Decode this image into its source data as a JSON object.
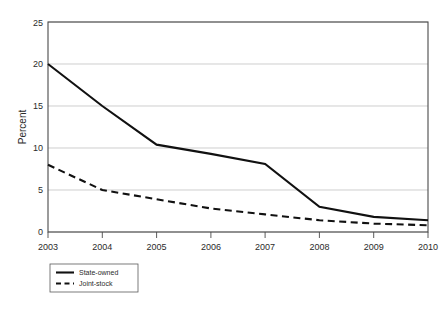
{
  "chart_data": {
    "type": "line",
    "title": "",
    "xlabel": "",
    "ylabel": "Percent",
    "x": [
      "2003",
      "2004",
      "2005",
      "2006",
      "2007",
      "2008",
      "2009",
      "2010"
    ],
    "categories": [
      "2003",
      "2004",
      "2005",
      "2006",
      "2007",
      "2008",
      "2009",
      "2010"
    ],
    "series": [
      {
        "name": "State-owned",
        "style": "solid",
        "values": [
          20.0,
          15.0,
          10.4,
          9.3,
          8.1,
          3.0,
          1.8,
          1.4
        ]
      },
      {
        "name": "Joint-stock",
        "style": "dashed",
        "values": [
          8.0,
          5.0,
          3.9,
          2.8,
          2.1,
          1.4,
          1.0,
          0.8
        ]
      }
    ],
    "ylim": [
      0,
      25
    ],
    "yticks": [
      0,
      5,
      10,
      15,
      20,
      25
    ],
    "ytick_labels": [
      "0",
      "5",
      "10",
      "15",
      "20",
      "25"
    ],
    "xtick_labels": [
      "2003",
      "2004",
      "2005",
      "2006",
      "2007",
      "2008",
      "2009",
      "2010"
    ],
    "grid": "horizontal",
    "legend_position": "below-left",
    "colors": {
      "line": "#111111",
      "gridline": "#b9b9b9",
      "frame": "#4a4a4a",
      "background": "#ffffff",
      "text": "#2b2b2b"
    }
  },
  "legend": {
    "entries": [
      {
        "label": "State-owned",
        "style": "solid"
      },
      {
        "label": "Joint-stock",
        "style": "dashed"
      }
    ]
  }
}
